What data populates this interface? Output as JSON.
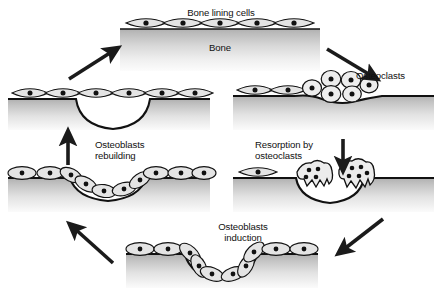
{
  "figure": {
    "background_color": "#ffffff",
    "ink_color": "#111111",
    "bone_gradient_top": "#b4b4b4",
    "bone_gradient_bottom": "#fbfbfb",
    "cell_fill": "#e2e2e2",
    "nucleus_color": "#111111"
  },
  "labels": {
    "bone_lining_cells": "Bone lining cells",
    "bone": "Bone",
    "osteoclasts": "Osteoclasts",
    "resorption_by_osteoclasts": "Resorption by\nosteoclasts",
    "osteoblasts_rebuilding": "Osteoblasts\nrebuilding",
    "osteoblasts_induction": "Osteoblasts\ninduction"
  },
  "panels": [
    {
      "id": "panel-quiescent",
      "position": "top",
      "label": "Bone lining cells",
      "secondary_label": "Bone",
      "description": "Quiescent bone surface covered by a continuous row of flat bone lining cells",
      "cell_type": "bone-lining-cell",
      "cell_count": 5,
      "surface": "flat",
      "pit_depth": 0
    },
    {
      "id": "panel-osteoclast-recruitment",
      "position": "right-upper",
      "label": "Osteoclasts",
      "description": "Osteoclast precursors recruited and clustered on the bone surface",
      "cell_type": "osteoclast-precursor",
      "lining_cell_count": 2,
      "osteoclast_count": 6,
      "surface": "bulge",
      "pit_depth": 0
    },
    {
      "id": "panel-resorption",
      "position": "right-lower",
      "label": "Resorption by osteoclasts",
      "description": "Multinucleated osteoclasts with ruffled borders excavate a resorption pit",
      "cell_type": "multinucleated-osteoclast",
      "lining_cell_count": 1,
      "osteoclast_count": 2,
      "nuclei_per_osteoclast": 4,
      "surface": "pit",
      "pit_depth": 22
    },
    {
      "id": "panel-induction",
      "position": "bottom",
      "label": "Osteoblasts induction",
      "description": "Osteoblasts are induced and line the full depth of the resorption pit",
      "cell_type": "osteoblast",
      "cell_count": 10,
      "surface": "pit",
      "pit_depth": 22
    },
    {
      "id": "panel-rebuilding",
      "position": "left-lower",
      "label": "Osteoblasts rebuilding",
      "description": "Osteoblasts deposit new bone matrix, progressively filling the cavity",
      "cell_type": "osteoblast",
      "cell_count": 10,
      "surface": "partially-filled-pit",
      "pit_depth": 13
    },
    {
      "id": "panel-restored",
      "position": "left-upper",
      "label": "",
      "description": "Cavity filled with new bone; surface re-covered by flat lining cells, completing the cycle",
      "cell_type": "bone-lining-cell",
      "cell_count": 6,
      "surface": "filled",
      "pit_depth": 0
    }
  ],
  "arrows": [
    {
      "id": "arrow-restored-to-quiescent",
      "from": "panel-restored",
      "to": "panel-quiescent",
      "direction": "up-right"
    },
    {
      "id": "arrow-quiescent-to-recruitment",
      "from": "panel-quiescent",
      "to": "panel-osteoclast-recruitment",
      "direction": "down-right"
    },
    {
      "id": "arrow-recruitment-to-resorption",
      "from": "panel-osteoclast-recruitment",
      "to": "panel-resorption",
      "direction": "down"
    },
    {
      "id": "arrow-resorption-to-induction",
      "from": "panel-resorption",
      "to": "panel-induction",
      "direction": "down-left"
    },
    {
      "id": "arrow-induction-to-rebuilding",
      "from": "panel-induction",
      "to": "panel-rebuilding",
      "direction": "up-left"
    },
    {
      "id": "arrow-rebuilding-to-restored",
      "from": "panel-rebuilding",
      "to": "panel-restored",
      "direction": "up"
    }
  ]
}
